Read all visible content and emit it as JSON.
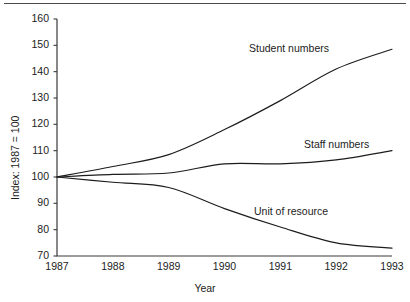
{
  "chart_data": {
    "type": "line",
    "title": "",
    "xlabel": "Year",
    "ylabel": "Index: 1987 = 100",
    "x": [
      1987,
      1988,
      1989,
      1990,
      1991,
      1992,
      1993
    ],
    "categories": [
      "1987",
      "1988",
      "1989",
      "1990",
      "1991",
      "1992",
      "1993"
    ],
    "xlim": [
      1987,
      1993
    ],
    "ylim": [
      70,
      160
    ],
    "ytick_values": [
      70,
      80,
      90,
      100,
      110,
      120,
      130,
      140,
      150,
      160
    ],
    "ytick_labels": [
      "70",
      "80",
      "90",
      "100",
      "110",
      "120",
      "130",
      "140",
      "150",
      "160"
    ],
    "grid": false,
    "legend_position": "inline-annotations",
    "series": [
      {
        "name": "Student numbers",
        "values": [
          100,
          104,
          108.5,
          118,
          129,
          141,
          148.5
        ],
        "color": "#1c1c1c"
      },
      {
        "name": "Staff numbers",
        "values": [
          100,
          101,
          101.5,
          105,
          105,
          106.5,
          110
        ],
        "color": "#1c1c1c"
      },
      {
        "name": "Unit of resource",
        "values": [
          100,
          98,
          96,
          88,
          81,
          75,
          73
        ],
        "color": "#1c1c1c"
      }
    ],
    "annotations": [
      {
        "text": "Student numbers",
        "x_px": 249,
        "y_px": 42
      },
      {
        "text": "Staff numbers",
        "x_px": 304,
        "y_px": 138
      },
      {
        "text": "Unit of resource",
        "x_px": 254,
        "y_px": 205
      }
    ]
  },
  "axes": {
    "y_label": "Index: 1987 = 100",
    "x_label": "Year"
  }
}
